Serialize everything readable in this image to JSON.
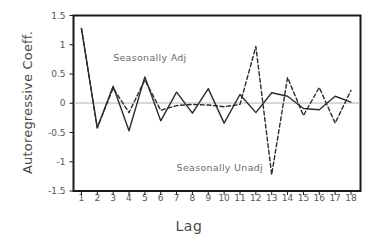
{
  "chart_data": {
    "type": "line",
    "title": "",
    "subtitle": "",
    "xlabel": "Lag",
    "ylabel": "Autoregressive Coeff.",
    "xlim": [
      0.5,
      18.6
    ],
    "ylim": [
      -1.5,
      1.5
    ],
    "grid": false,
    "zero_line": true,
    "legend_position": "inline-annotations",
    "x": [
      1,
      2,
      3,
      4,
      5,
      6,
      7,
      8,
      9,
      10,
      11,
      12,
      13,
      14,
      15,
      16,
      17,
      18
    ],
    "xticks": [
      "1",
      "2",
      "3",
      "4",
      "5",
      "6",
      "7",
      "8",
      "9",
      "10",
      "11",
      "12",
      "13",
      "14",
      "15",
      "16",
      "17",
      "18"
    ],
    "yticks": [
      "-1.5",
      "-1",
      "-0.5",
      "0",
      "0.5",
      "1",
      "1.5"
    ],
    "ytick_values": [
      -1.5,
      -1,
      -0.5,
      0,
      0.5,
      1,
      1.5
    ],
    "series": [
      {
        "name": "Seasonally Adj",
        "style": "solid",
        "color": "#2b2b2b",
        "values": [
          1.28,
          -0.42,
          0.29,
          -0.47,
          0.45,
          -0.3,
          0.19,
          -0.17,
          0.25,
          -0.34,
          0.15,
          -0.16,
          0.18,
          0.12,
          -0.09,
          -0.11,
          0.12,
          0.02
        ]
      },
      {
        "name": "Seasonally Unadj",
        "style": "dashed",
        "color": "#2b2b2b",
        "values": [
          1.28,
          -0.42,
          0.26,
          -0.16,
          0.4,
          -0.12,
          -0.04,
          -0.02,
          -0.03,
          -0.06,
          -0.02,
          0.97,
          -1.22,
          0.44,
          -0.21,
          0.27,
          -0.34,
          0.22
        ]
      }
    ],
    "annotations": [
      {
        "text": "Seasonally Adj",
        "x": 3.0,
        "y": 0.78
      },
      {
        "text": "Seasonally Unadj",
        "x": 7.0,
        "y": -1.1
      }
    ],
    "axes_color": "#1a1a1a",
    "zero_line_color": "#b0b0b0",
    "background": "#ffffff"
  }
}
